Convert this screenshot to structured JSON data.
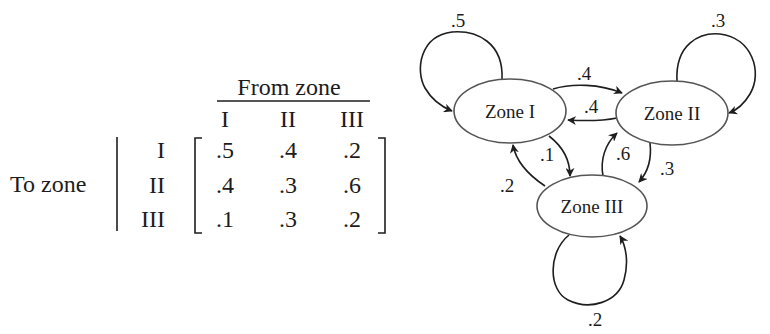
{
  "matrix": {
    "column_group_label": "From zone",
    "row_group_label": "To zone",
    "column_headers": [
      "I",
      "II",
      "III"
    ],
    "row_headers": [
      "I",
      "II",
      "III"
    ],
    "rows": [
      [
        ".5",
        ".4",
        ".2"
      ],
      [
        ".4",
        ".3",
        ".6"
      ],
      [
        ".1",
        ".3",
        ".2"
      ]
    ]
  },
  "graph": {
    "nodes": [
      {
        "id": "zone-1",
        "label": "Zone I"
      },
      {
        "id": "zone-2",
        "label": "Zone II"
      },
      {
        "id": "zone-3",
        "label": "Zone III"
      }
    ],
    "edges": [
      {
        "from": "Zone I",
        "to": "Zone I",
        "label": ".5"
      },
      {
        "from": "Zone II",
        "to": "Zone II",
        "label": ".3"
      },
      {
        "from": "Zone III",
        "to": "Zone III",
        "label": ".2"
      },
      {
        "from": "Zone I",
        "to": "Zone II",
        "label": ".4"
      },
      {
        "from": "Zone II",
        "to": "Zone I",
        "label": ".4"
      },
      {
        "from": "Zone I",
        "to": "Zone III",
        "label": ".1"
      },
      {
        "from": "Zone III",
        "to": "Zone I",
        "label": ".2"
      },
      {
        "from": "Zone III",
        "to": "Zone II",
        "label": ".6"
      },
      {
        "from": "Zone II",
        "to": "Zone III",
        "label": ".3"
      }
    ]
  },
  "colors": {
    "ink": "#1c1c1c",
    "node_outline": "#555555",
    "background": "#ffffff"
  }
}
